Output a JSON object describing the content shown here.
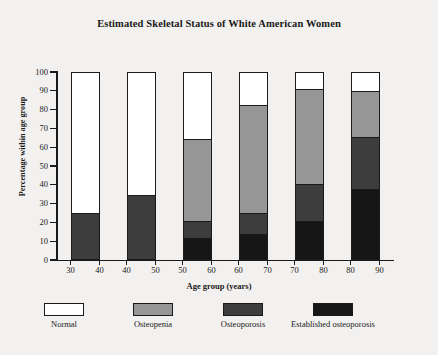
{
  "chart_data": {
    "type": "bar",
    "stacked": true,
    "title": "Estimated Skeletal Status of White American Women",
    "xlabel": "Age group (years)",
    "ylabel": "Percentage within age group",
    "ylim": [
      0,
      100
    ],
    "yticks": [
      0,
      10,
      20,
      30,
      40,
      50,
      60,
      70,
      80,
      90,
      100
    ],
    "xticks": [
      30,
      40,
      40,
      50,
      50,
      60,
      60,
      70,
      70,
      80,
      80,
      90
    ],
    "categories": [
      "30-40",
      "40-50",
      "50-60",
      "60-70",
      "70-80",
      "80-90"
    ],
    "category_bounds": [
      [
        30,
        40
      ],
      [
        40,
        50
      ],
      [
        50,
        60
      ],
      [
        60,
        70
      ],
      [
        70,
        80
      ],
      [
        80,
        90
      ]
    ],
    "grid": false,
    "legend_position": "bottom",
    "series": [
      {
        "name": "Normal",
        "color": "#ffffff",
        "values": [
          76,
          66,
          36,
          18,
          9,
          10
        ]
      },
      {
        "name": "Osteopenia",
        "color": "#969696",
        "values": [
          24,
          34,
          44,
          58,
          51,
          25
        ]
      },
      {
        "name": "Osteoporosis",
        "color": "#3d3d3d",
        "values": [
          0,
          0,
          9,
          11,
          20,
          28
        ]
      },
      {
        "name": "Established osteoporosis",
        "color": "#161616",
        "values": [
          0,
          0,
          11,
          13,
          20,
          37
        ]
      }
    ],
    "segment_tops": {
      "30-40": {
        "osteopenia": 24,
        "osteoporosis": 24,
        "established": 0,
        "normal": 100
      },
      "40-50": {
        "osteopenia": 34,
        "osteoporosis": 34,
        "established": 0,
        "normal": 100
      },
      "50-60": {
        "established": 11,
        "osteoporosis": 20,
        "osteopenia": 64,
        "normal": 100
      },
      "60-70": {
        "established": 13,
        "osteoporosis": 24,
        "osteopenia": 82,
        "normal": 100
      },
      "70-80": {
        "established": 20,
        "osteoporosis": 40,
        "osteopenia": 91,
        "normal": 100
      },
      "80-90": {
        "established": 37,
        "osteoporosis": 65,
        "osteopenia": 90,
        "normal": 100
      }
    }
  },
  "legend": {
    "items": [
      {
        "label": "Normal",
        "color": "#ffffff"
      },
      {
        "label": "Osteopenia",
        "color": "#969696"
      },
      {
        "label": "Osteoporosis",
        "color": "#3d3d3d"
      },
      {
        "label": "Established osteoporosis",
        "color": "#161616"
      }
    ]
  }
}
